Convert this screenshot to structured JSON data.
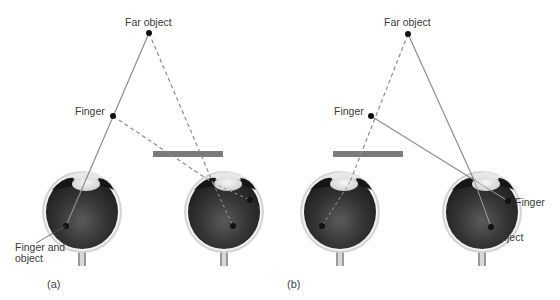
{
  "panels": [
    {
      "id": "a",
      "panel_label": "(a)",
      "labels": {
        "far_object": "Far object",
        "finger": "Finger",
        "retina_combined_line1": "Finger and",
        "retina_combined_line2": "object"
      },
      "line_styles": {
        "left_eye_sightline": "solid",
        "right_eye_sightlines": "dashed"
      },
      "occluder": "right eye covered by bar"
    },
    {
      "id": "b",
      "panel_label": "(b)",
      "labels": {
        "far_object": "Far object",
        "finger": "Finger",
        "retina_finger": "Finger",
        "retina_object": "Object"
      },
      "line_styles": {
        "left_eye_sightline": "dashed",
        "right_eye_sightlines": "solid"
      },
      "occluder": "left eye covered by bar"
    }
  ],
  "colors": {
    "background": "#ffffff",
    "line": "#8a8a8a",
    "dot": "#111111",
    "occluder_bar": "#7a7a7a",
    "eyeball_dark": "#2a2a2a",
    "eyeball_rim": "#c8c8c8",
    "lens": "#e6e6e6",
    "label_text": "#3a3a3a"
  }
}
